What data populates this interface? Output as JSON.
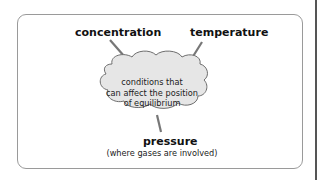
{
  "diagram": {
    "center": "conditions that can affect the position of equilibrium",
    "center_lines": [
      "conditions that",
      "can affect the position",
      "of equilibrium"
    ],
    "factors": [
      {
        "label": "concentration"
      },
      {
        "label": "temperature"
      },
      {
        "label": "pressure",
        "note": "(where gases are involved)"
      }
    ]
  },
  "colors": {
    "cloud_fill": "#e6e6e6",
    "cloud_stroke": "#6e6e6e",
    "line": "#777777",
    "frame": "#9a9a9a"
  }
}
